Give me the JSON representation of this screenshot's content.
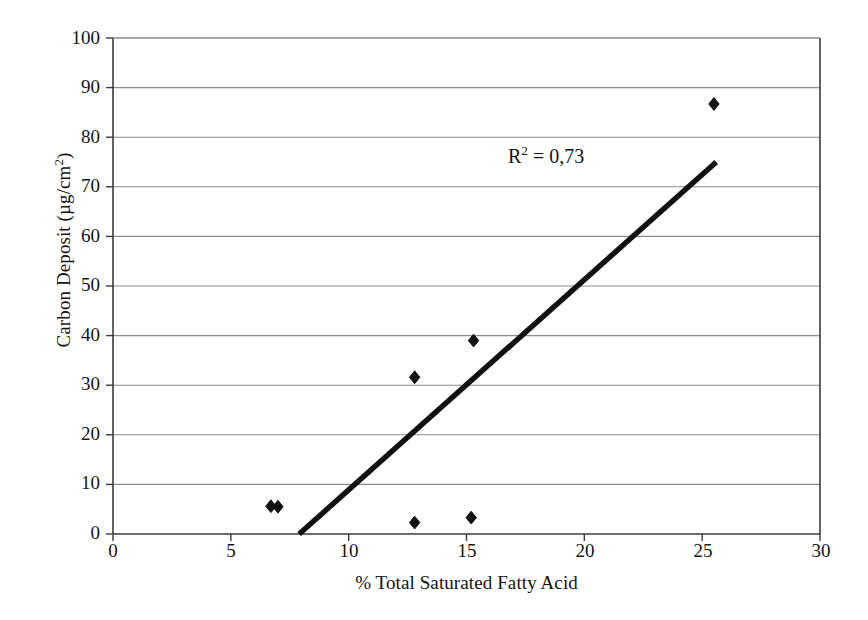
{
  "chart_data": {
    "type": "scatter",
    "title": "",
    "xlabel": "% Total Saturated Fatty Acid",
    "ylabel": "Carbon Deposit (µg/cm²)",
    "ylabel_parts": {
      "prefix": "Carbon Deposit (µg/cm",
      "sup": "2",
      "suffix": ")"
    },
    "xlim": [
      0,
      30
    ],
    "ylim": [
      0,
      100
    ],
    "xticks": [
      0,
      5,
      10,
      15,
      20,
      25,
      30
    ],
    "yticks": [
      0,
      10,
      20,
      30,
      40,
      50,
      60,
      70,
      80,
      90,
      100
    ],
    "xtick_labels": [
      "0",
      "5",
      "10",
      "15",
      "20",
      "25",
      "30"
    ],
    "ytick_labels": [
      "0",
      "10",
      "20",
      "30",
      "40",
      "50",
      "60",
      "70",
      "80",
      "90",
      "100"
    ],
    "grid": {
      "horizontal": true,
      "vertical": false
    },
    "legend": null,
    "series": [
      {
        "name": "Carbon Deposit",
        "marker": "diamond",
        "color": "#111111",
        "points": [
          {
            "x": 6.7,
            "y": 5.6
          },
          {
            "x": 7.0,
            "y": 5.5
          },
          {
            "x": 12.8,
            "y": 2.3
          },
          {
            "x": 12.8,
            "y": 31.6
          },
          {
            "x": 15.2,
            "y": 3.3
          },
          {
            "x": 15.3,
            "y": 39.0
          },
          {
            "x": 25.5,
            "y": 86.7
          }
        ]
      }
    ],
    "trendline": {
      "name": "linear-fit",
      "color": "#111111",
      "x0": 7.9,
      "y0": 0,
      "x1": 25.6,
      "y1": 75
    },
    "annotations": [
      {
        "name": "r-squared",
        "text": "R² = 0,73",
        "text_prefix": "R",
        "text_sup": "2",
        "text_suffix": " = 0,73",
        "x": 17.0,
        "y": 79.5
      }
    ],
    "colors": {
      "axis": "#3a3a3a",
      "grid": "#8a8a8a",
      "marker": "#111111",
      "trendline": "#111111",
      "text": "#141414",
      "background": "#ffffff"
    }
  }
}
